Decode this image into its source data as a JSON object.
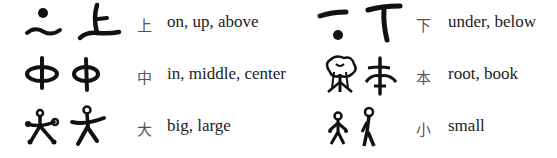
{
  "left_column": [
    {
      "ancient_icon": "shang-ancient-glyphs",
      "hanzi": "上",
      "meaning": "on, up, above"
    },
    {
      "ancient_icon": "zhong-ancient-glyphs",
      "hanzi": "中",
      "meaning": "in, middle, center"
    },
    {
      "ancient_icon": "da-ancient-glyphs",
      "hanzi": "大",
      "meaning": "big, large"
    }
  ],
  "right_column": [
    {
      "ancient_icon": "xia-ancient-glyphs",
      "hanzi": "下",
      "meaning": "under, below"
    },
    {
      "ancient_icon": "ben-ancient-glyphs",
      "hanzi": "本",
      "meaning": "root, book"
    },
    {
      "ancient_icon": "xiao-ancient-glyphs",
      "hanzi": "小",
      "meaning": "small"
    }
  ],
  "colors": {
    "ink": "#111111",
    "modern_char": "#555555",
    "text": "#222222",
    "background": "#ffffff"
  }
}
